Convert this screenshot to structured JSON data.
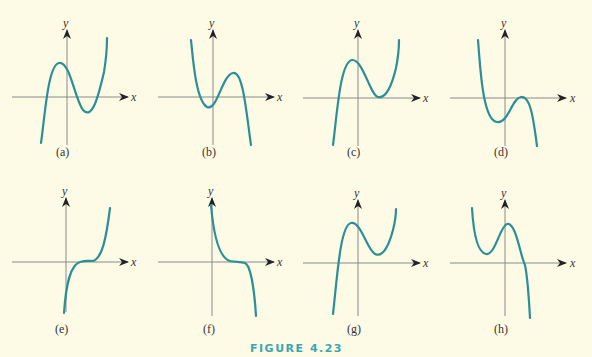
{
  "figure": {
    "caption": "FIGURE 4.23",
    "caption_color": "#3aa7b0",
    "curve_color": "#2a8f96",
    "background": "#fdfbe6"
  },
  "axes": {
    "x_label": "x",
    "y_label": "y"
  },
  "panels": [
    {
      "id": "a",
      "label": "(a)",
      "description": "cubic, positive leading coefficient, local max then local min below x-axis, three real roots"
    },
    {
      "id": "b",
      "label": "(b)",
      "description": "cubic, negative leading coefficient, local min below x-axis then local max above, three real roots"
    },
    {
      "id": "c",
      "label": "(c)",
      "description": "cubic, positive leading coefficient, local min touching x-axis (double root)"
    },
    {
      "id": "d",
      "label": "(d)",
      "description": "cubic, negative leading coefficient, local max touching x-axis (double root)"
    },
    {
      "id": "e",
      "label": "(e)",
      "description": "increasing cubic with inflection point on x-axis (triple root)"
    },
    {
      "id": "f",
      "label": "(f)",
      "description": "decreasing cubic with inflection point on x-axis (triple root)"
    },
    {
      "id": "g",
      "label": "(g)",
      "description": "cubic, positive leading coefficient, local max and local min both above x-axis, one real root"
    },
    {
      "id": "h",
      "label": "(h)",
      "description": "cubic, negative leading coefficient, local min and local max both above x-axis, one real root"
    }
  ]
}
